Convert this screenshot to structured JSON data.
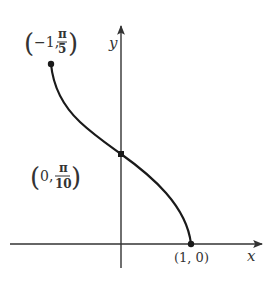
{
  "diagram": {
    "type": "function-graph",
    "axes": {
      "x_label": "x",
      "y_label": "y"
    },
    "points": [
      {
        "label_prefix": "(−1, ",
        "num": "π",
        "den": "5",
        "label_suffix": ")",
        "x": -1,
        "y": "π/5"
      },
      {
        "label_prefix": "(0, ",
        "num": "π",
        "den": "10",
        "label_suffix": ")",
        "x": 0,
        "y": "π/10"
      },
      {
        "label": "(1, 0)",
        "x": 1,
        "y": 0
      }
    ],
    "colors": {
      "curve": "#1a1a1a",
      "axes": "#333333",
      "text": "#333333"
    }
  }
}
